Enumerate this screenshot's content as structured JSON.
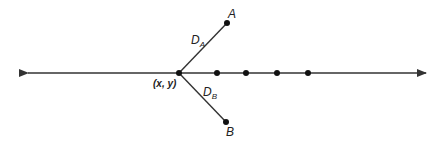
{
  "diagram": {
    "origin_label": "(x, y)",
    "point_a_label": "A",
    "point_b_label": "B",
    "distance_a": {
      "main": "D",
      "sub": "A"
    },
    "distance_b": {
      "main": "D",
      "sub": "B"
    },
    "line_color": "#333333",
    "dot_count_on_line": 4
  }
}
